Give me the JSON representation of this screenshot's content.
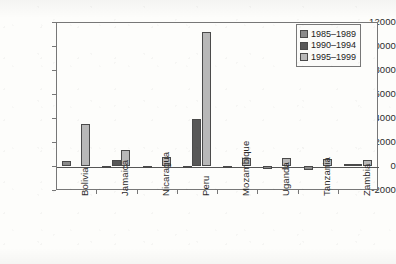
{
  "chart_data": {
    "type": "bar",
    "title": "",
    "subtitle": "",
    "xlabel": "",
    "ylabel": "",
    "ylim": [
      -2000,
      12000
    ],
    "ytick_labels": [
      "12000",
      "10000",
      "8000",
      "6000",
      "4000",
      "2000",
      "0",
      "-2000"
    ],
    "ytick_values": [
      12000,
      10000,
      8000,
      6000,
      4000,
      2000,
      0,
      -2000
    ],
    "grid": false,
    "legend_position": "top-right",
    "categories": [
      "Bolivia",
      "Jamaica",
      "Nicaragua",
      "Peru",
      "Mozambique",
      "Uganda",
      "Tanzania",
      "Zambia"
    ],
    "series": [
      {
        "name": "1985–1989",
        "color": "#8a8a8a",
        "values": [
          400,
          -180,
          -160,
          -120,
          -200,
          -230,
          -330,
          180
        ]
      },
      {
        "name": "1990–1994",
        "color": "#585858",
        "values": [
          0,
          500,
          0,
          3900,
          0,
          0,
          0,
          180
        ]
      },
      {
        "name": "1995–1999",
        "color": "#b8b8b8",
        "values": [
          3480,
          1350,
          750,
          11150,
          650,
          660,
          570,
          540
        ]
      }
    ]
  },
  "legend": {
    "entries": [
      {
        "label": "1985–1989",
        "color": "#8a8a8a",
        "swatch_name": "legend-swatch-1985-1989"
      },
      {
        "label": "1990–1994",
        "color": "#585858",
        "swatch_name": "legend-swatch-1990-1994"
      },
      {
        "label": "1995–1999",
        "color": "#b8b8b8",
        "swatch_name": "legend-swatch-1995-1999"
      }
    ]
  },
  "axis": {
    "y_labels": [
      "12000",
      "10000",
      "8000",
      "6000",
      "4000",
      "2000",
      "0",
      "-2000"
    ],
    "x_labels": [
      "Bolivia",
      "Jamaica",
      "Nicaragua",
      "Peru",
      "Mozambique",
      "Uganda",
      "Tanzania",
      "Zambia"
    ]
  },
  "style": {
    "frame_color": "#777777",
    "background": "#fdfdfb",
    "bar_edge": "#4a4a4a"
  }
}
